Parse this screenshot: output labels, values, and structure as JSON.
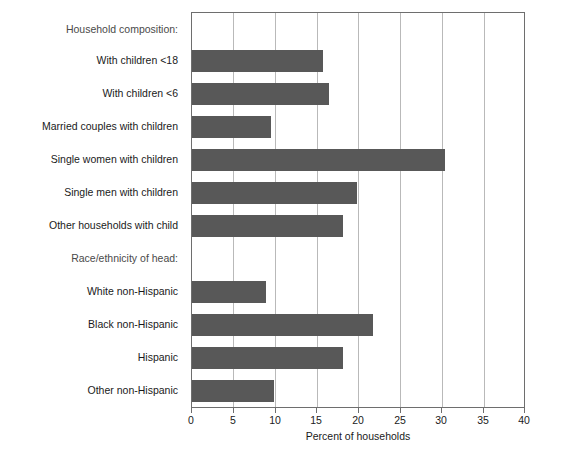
{
  "chart_data": {
    "type": "bar",
    "orientation": "horizontal",
    "title": "",
    "xlabel": "Percent of households",
    "ylabel": "",
    "xlim": [
      0,
      40
    ],
    "xticks": [
      0,
      5,
      10,
      15,
      20,
      25,
      30,
      35,
      40
    ],
    "xtick_labels": [
      "0",
      "5",
      "10",
      "15",
      "20",
      "25",
      "30",
      "35",
      "40"
    ],
    "grid": "vertical",
    "legend": "none",
    "bar_color": "#585858",
    "groups": [
      {
        "heading": "Household composition:",
        "categories": [
          "With children <18",
          "With children <6",
          "Married couples with children",
          "Single women with children",
          "Single men with children",
          "Other households with child"
        ],
        "values": [
          15.7,
          16.5,
          9.5,
          30.4,
          19.8,
          18.1
        ]
      },
      {
        "heading": "Race/ethnicity of head:",
        "categories": [
          "White non-Hispanic",
          "Black non-Hispanic",
          "Hispanic",
          "Other non-Hispanic"
        ],
        "values": [
          8.9,
          21.8,
          18.1,
          9.9
        ]
      }
    ],
    "rows": [
      {
        "label": "Household composition:",
        "value": null,
        "is_heading": true
      },
      {
        "label": "With children <18",
        "value": 15.7,
        "is_heading": false
      },
      {
        "label": "With children <6",
        "value": 16.5,
        "is_heading": false
      },
      {
        "label": "Married couples with children",
        "value": 9.5,
        "is_heading": false
      },
      {
        "label": "Single women with children",
        "value": 30.4,
        "is_heading": false
      },
      {
        "label": "Single men with children",
        "value": 19.8,
        "is_heading": false
      },
      {
        "label": "Other households with child",
        "value": 18.1,
        "is_heading": false
      },
      {
        "label": "Race/ethnicity of head:",
        "value": null,
        "is_heading": true
      },
      {
        "label": "White non-Hispanic",
        "value": 8.9,
        "is_heading": false
      },
      {
        "label": "Black non-Hispanic",
        "value": 21.8,
        "is_heading": false
      },
      {
        "label": "Hispanic",
        "value": 18.1,
        "is_heading": false
      },
      {
        "label": "Other non-Hispanic",
        "value": 9.9,
        "is_heading": false
      }
    ]
  }
}
